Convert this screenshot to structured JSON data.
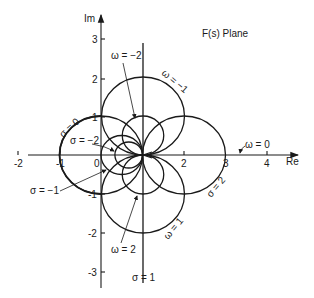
{
  "title": "F(s) Plane",
  "axes": {
    "x_label": "Re",
    "y_label": "Im",
    "x_ticks": [
      "-2",
      "-1",
      "0",
      "2",
      "3",
      "4"
    ],
    "y_ticks": [
      "3",
      "2",
      "1",
      "-1",
      "-2",
      "-3"
    ]
  },
  "curves": {
    "sigma_0": "σ = 0",
    "sigma_neg2": "σ = −2",
    "sigma_neg1": "σ = −1",
    "sigma_2": "σ = 2",
    "sigma_1": "σ = 1",
    "omega_neg2": "ω = −2",
    "omega_neg1": "ω = −1",
    "omega_0": "ω = 0",
    "omega_1": "ω = 1",
    "omega_2": "ω = 2"
  },
  "colors": {
    "ink": "#1a1a1a",
    "background": "#ffffff"
  }
}
